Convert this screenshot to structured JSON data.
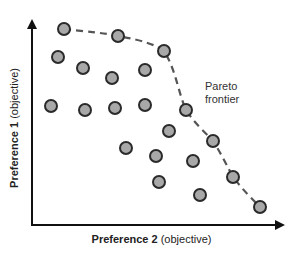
{
  "chart_data": {
    "type": "scatter",
    "title": "",
    "xlabel": "Preference 2 (objective)",
    "ylabel": "Preference 1 (objective)",
    "xlabel_bold": "Preference 2",
    "xlabel_rest": " (objective)",
    "ylabel_bold": "Preference 1",
    "ylabel_rest": " (objective)",
    "grid": false,
    "legend": null,
    "annotations": [
      {
        "text": "Pareto frontier",
        "line1": "Pareto",
        "line2": "frontier"
      }
    ],
    "points_px": [
      {
        "x": 64,
        "y": 29,
        "frontier": true
      },
      {
        "x": 118,
        "y": 36,
        "frontier": true
      },
      {
        "x": 164,
        "y": 51,
        "frontier": true
      },
      {
        "x": 58,
        "y": 57
      },
      {
        "x": 83,
        "y": 68
      },
      {
        "x": 112,
        "y": 78
      },
      {
        "x": 145,
        "y": 70
      },
      {
        "x": 51,
        "y": 106
      },
      {
        "x": 85,
        "y": 110
      },
      {
        "x": 115,
        "y": 108
      },
      {
        "x": 145,
        "y": 105
      },
      {
        "x": 186,
        "y": 110,
        "frontier": true
      },
      {
        "x": 169,
        "y": 131
      },
      {
        "x": 213,
        "y": 141,
        "frontier": true
      },
      {
        "x": 126,
        "y": 148
      },
      {
        "x": 156,
        "y": 156
      },
      {
        "x": 193,
        "y": 161
      },
      {
        "x": 233,
        "y": 177,
        "frontier": true
      },
      {
        "x": 159,
        "y": 182
      },
      {
        "x": 200,
        "y": 195
      },
      {
        "x": 260,
        "y": 207,
        "frontier": true
      }
    ],
    "frontier_path_px": "M64,29 C90,32 105,33 118,36 C140,40 155,44 164,51 C176,70 178,92 186,110 C195,124 205,132 213,141 C222,155 228,168 233,177 C243,190 252,199 260,207",
    "colors": {
      "point_fill": "#a8a8a8",
      "point_stroke": "#2a2a2a",
      "axis": "#111111",
      "frontier": "#555555"
    }
  }
}
